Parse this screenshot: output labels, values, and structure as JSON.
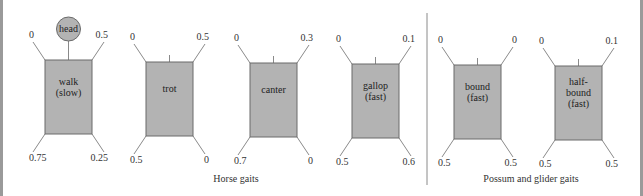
{
  "figure": {
    "head_label": "head",
    "groups": [
      {
        "caption": "Horse gaits"
      },
      {
        "caption": "Possum and glider gaits"
      }
    ],
    "gaits": [
      {
        "id": "walk",
        "group": 0,
        "label": [
          "walk",
          "(slow)"
        ],
        "front_left": "0",
        "front_right": "0.5",
        "hind_left": "0.75",
        "hind_right": "0.25",
        "show_head": true
      },
      {
        "id": "trot",
        "group": 0,
        "label": [
          "trot"
        ],
        "front_left": "0",
        "front_right": "0.5",
        "hind_left": "0.5",
        "hind_right": "0",
        "show_head": false
      },
      {
        "id": "canter",
        "group": 0,
        "label": [
          "canter"
        ],
        "front_left": "0",
        "front_right": "0.3",
        "hind_left": "0.7",
        "hind_right": "0",
        "show_head": false
      },
      {
        "id": "gallop",
        "group": 0,
        "label": [
          "gallop",
          "(fast)"
        ],
        "front_left": "0",
        "front_right": "0.1",
        "hind_left": "0.5",
        "hind_right": "0.6",
        "show_head": false
      },
      {
        "id": "bound",
        "group": 1,
        "label": [
          "bound",
          "(fast)"
        ],
        "front_left": "0",
        "front_right": "0",
        "hind_left": "0.5",
        "hind_right": "0.5",
        "show_head": false
      },
      {
        "id": "half-bound",
        "group": 1,
        "label": [
          "half-",
          "bound",
          "(fast)"
        ],
        "front_left": "0",
        "front_right": "0.1",
        "hind_left": "0.5",
        "hind_right": "0.5",
        "show_head": false
      }
    ],
    "colors": {
      "body_fill": "#b3b3b3",
      "body_stroke": "#6a6a6a",
      "line": "#8a8a8a",
      "border": "#9a9a9a"
    }
  }
}
